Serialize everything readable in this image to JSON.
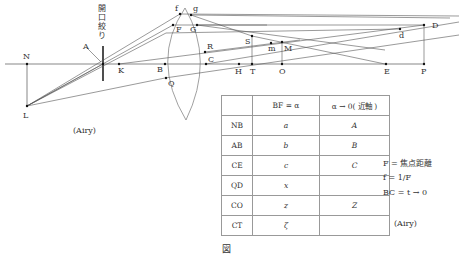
{
  "figure": {
    "aperture_label": [
      "開",
      "口",
      "絞",
      "り"
    ],
    "points": {
      "N": "N",
      "L": "L",
      "A": "A",
      "K": "K",
      "B": "B",
      "Q": "Q",
      "f": "f",
      "g": "g",
      "F": "F",
      "G": "G",
      "R": "R",
      "C": "C",
      "S": "S",
      "m": "m",
      "M": "M",
      "H": "H",
      "T": "T",
      "O": "O",
      "E": "E",
      "P": "P",
      "D": "D",
      "d": "d"
    },
    "source_left": "(Airy)",
    "source_right": "(Airy)",
    "caption": "図"
  },
  "table": {
    "headers": [
      "",
      "BF = α",
      "α → 0( 近軸 )"
    ],
    "rows": [
      {
        "label": "NB",
        "general": "a",
        "paraxial": "A"
      },
      {
        "label": "AB",
        "general": "b",
        "paraxial": "B"
      },
      {
        "label": "CE",
        "general": "c",
        "paraxial": "C"
      },
      {
        "label": "QD",
        "general": "x",
        "paraxial": ""
      },
      {
        "label": "CO",
        "general": "z",
        "paraxial": "Z"
      },
      {
        "label": "CT",
        "general": "ζ",
        "paraxial": ""
      }
    ]
  },
  "notes": {
    "line1": "F = 焦点距離",
    "line2": "f = 1/F",
    "line3": "BC = t → 0"
  }
}
